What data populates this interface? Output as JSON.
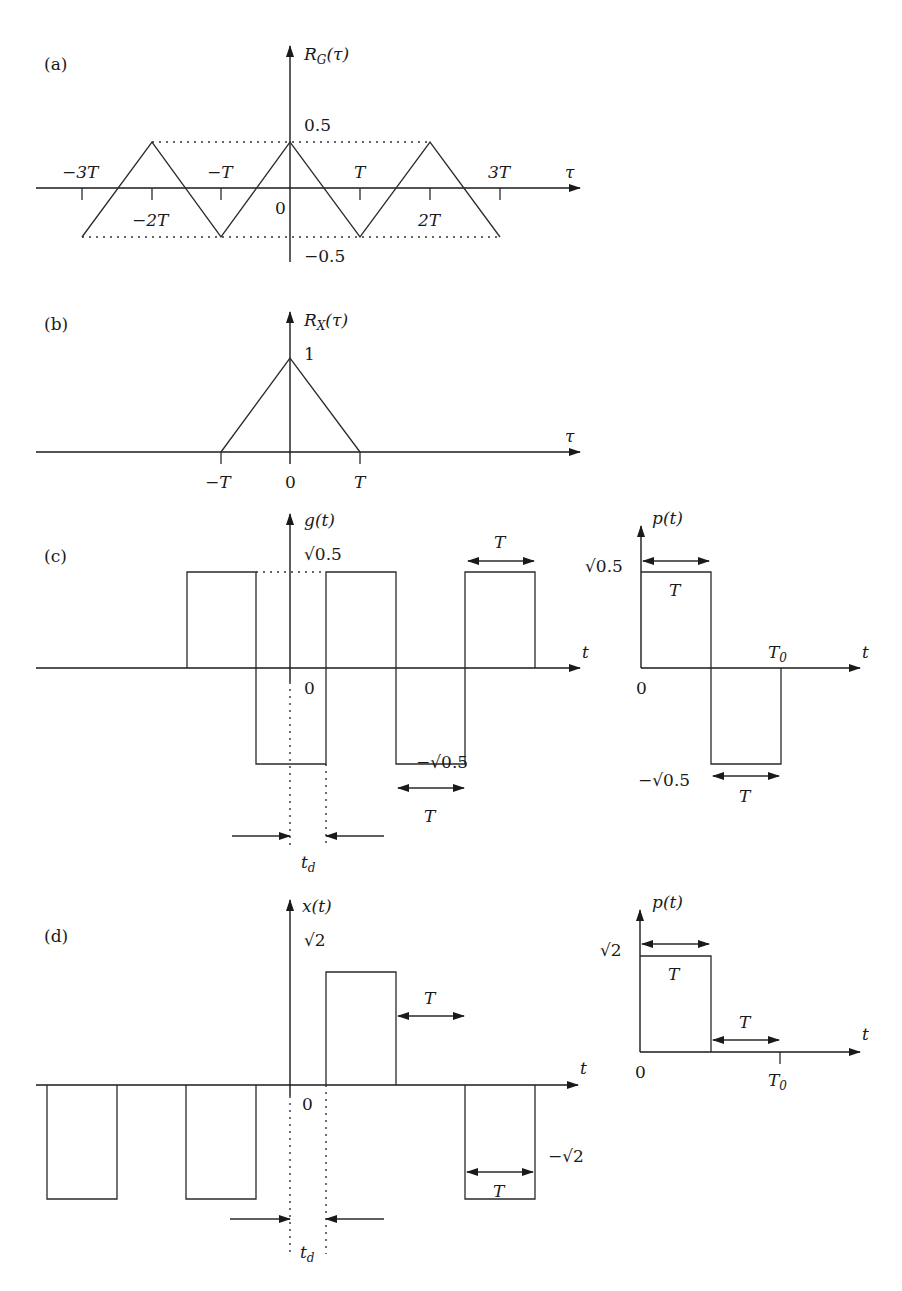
{
  "figure": {
    "panels": [
      {
        "id": "a",
        "label": "(a)",
        "y_label": "R_G(τ)",
        "x_label": "τ",
        "x_ticks": [
          "−3T",
          "−2T",
          "−T",
          "0",
          "T",
          "2T",
          "3T"
        ],
        "y_ticks": [
          "0.5",
          "−0.5"
        ]
      },
      {
        "id": "b",
        "label": "(b)",
        "y_label": "R_X(τ)",
        "x_label": "τ",
        "x_ticks": [
          "−T",
          "0",
          "T"
        ],
        "y_ticks": [
          "1"
        ]
      },
      {
        "id": "c",
        "label": "(c)",
        "y_label": "g(t)",
        "x_label": "t",
        "y_ticks": [
          "√0.5",
          "−√0.5"
        ],
        "origin": "0",
        "period_label": "T",
        "delay_label": "t",
        "delay_sub": "d",
        "pulse": {
          "y_label": "p(t)",
          "x_label": "t",
          "top": "√0.5",
          "bottom": "−√0.5",
          "origin": "0",
          "T": "T",
          "T0": "T",
          "T0_sub": "0"
        }
      },
      {
        "id": "d",
        "label": "(d)",
        "y_label": "x(t)",
        "x_label": "t",
        "y_ticks": [
          "√2",
          "−√2"
        ],
        "origin": "0",
        "period_label": "T",
        "delay_label": "t",
        "delay_sub": "d",
        "pulse": {
          "y_label": "p(t)",
          "x_label": "t",
          "top": "√2",
          "origin": "0",
          "T": "T",
          "T0": "T",
          "T0_sub": "0"
        }
      }
    ]
  },
  "chart_data": [
    {
      "type": "line",
      "title": "(a) R_G(τ)",
      "xlabel": "τ",
      "ylabel": "R_G(τ)",
      "x": [
        -3,
        -2,
        -1,
        0,
        1,
        2,
        3
      ],
      "values": [
        -0.5,
        0.5,
        -0.5,
        0.5,
        -0.5,
        0.5,
        -0.5
      ],
      "x_units": "T",
      "ylim": [
        -0.5,
        0.5
      ]
    },
    {
      "type": "line",
      "title": "(b) R_X(τ)",
      "xlabel": "τ",
      "ylabel": "R_X(τ)",
      "x": [
        -1,
        0,
        1
      ],
      "values": [
        0,
        1,
        0
      ],
      "x_units": "T",
      "ylim": [
        0,
        1
      ]
    },
    {
      "type": "line",
      "title": "(c) g(t)",
      "xlabel": "t",
      "ylabel": "g(t)",
      "description": "square wave amplitude ±√0.5, half-period T, delayed by t_d",
      "levels": [
        "√0.5",
        "−√0.5"
      ]
    },
    {
      "type": "line",
      "title": "(c) p(t)",
      "xlabel": "t",
      "ylabel": "p(t)",
      "description": "+√0.5 on [0,T], −√0.5 on [T,T0]"
    },
    {
      "type": "line",
      "title": "(d) x(t)",
      "xlabel": "t",
      "ylabel": "x(t)",
      "description": "random pulses ±√2 of width T, delayed by t_d",
      "levels": [
        "√2",
        "−√2"
      ]
    },
    {
      "type": "line",
      "title": "(d) p(t)",
      "xlabel": "t",
      "ylabel": "p(t)",
      "description": "√2 on [0,T], 0 on [T,T0]"
    }
  ]
}
